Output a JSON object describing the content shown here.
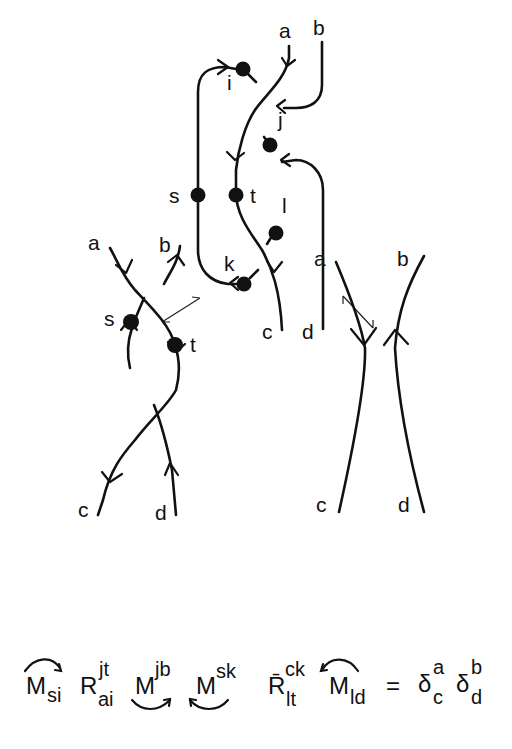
{
  "figure": {
    "top_diagram": {
      "endpoint_labels": [
        "a",
        "b",
        "c",
        "d"
      ],
      "vertex_labels": [
        "i",
        "j",
        "s",
        "t",
        "l",
        "k"
      ]
    },
    "left_diagram": {
      "endpoint_labels": [
        "a",
        "b",
        "c",
        "d"
      ],
      "vertex_labels": [
        "s",
        "t"
      ]
    },
    "right_diagram": {
      "endpoint_labels": [
        "a",
        "b",
        "c",
        "d"
      ]
    },
    "equation": {
      "terms": [
        {
          "symbol": "M",
          "sub": "si",
          "sup": "",
          "arc": "over-right"
        },
        {
          "symbol": "R",
          "sub": "ai",
          "sup": "jt",
          "arc": ""
        },
        {
          "symbol": "M",
          "sub": "",
          "sup": "jb",
          "arc": "under-right"
        },
        {
          "symbol": "M",
          "sub": "",
          "sup": "sk",
          "arc": "under-left"
        },
        {
          "symbol": "R̄",
          "sub": "lt",
          "sup": "ck",
          "arc": ""
        },
        {
          "symbol": "M",
          "sub": "ld",
          "sup": "",
          "arc": "over-left"
        }
      ],
      "equals": "=",
      "rhs": [
        {
          "symbol": "δ",
          "sub": "c",
          "sup": "a"
        },
        {
          "symbol": "δ",
          "sub": "d",
          "sup": "b"
        }
      ]
    }
  }
}
